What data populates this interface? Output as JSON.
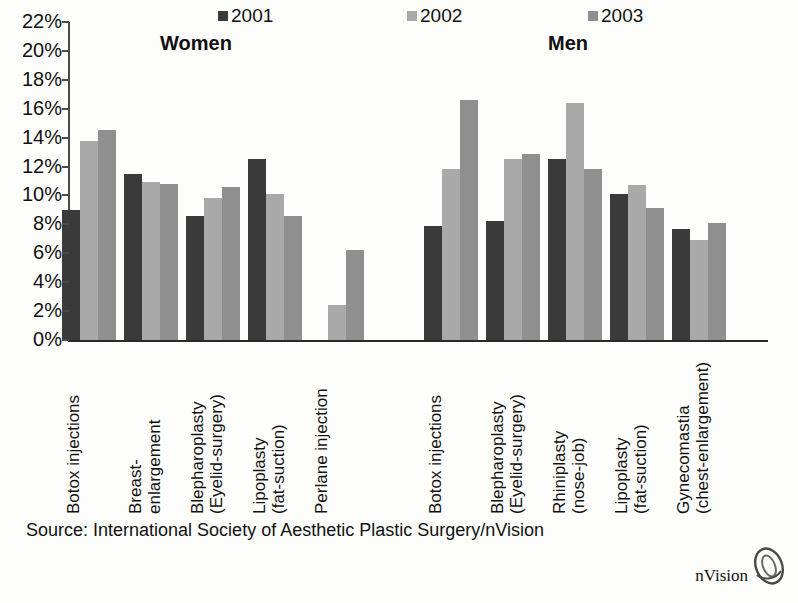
{
  "legend": {
    "items": [
      {
        "label": "2001",
        "color": "#3a3a3a",
        "x": 218
      },
      {
        "label": "2002",
        "color": "#a9a9a9",
        "x": 407
      },
      {
        "label": "2003",
        "color": "#8f8f8f",
        "x": 588
      }
    ]
  },
  "panels": [
    {
      "title": "Women",
      "x": 160
    },
    {
      "title": "Men",
      "x": 548
    }
  ],
  "axis": {
    "ticks": [
      "22%",
      "20%",
      "18%",
      "16%",
      "14%",
      "12%",
      "10%",
      "8%",
      "6%",
      "4%",
      "2%",
      "0%"
    ]
  },
  "source": {
    "text": "Source: International Society of Aesthetic Plastic Surgery/nVision",
    "brand": "nVision"
  },
  "chart_data": {
    "type": "bar",
    "title": "",
    "xlabel": "",
    "ylabel": "",
    "ylim": [
      0,
      22
    ],
    "ytick_step": 2,
    "grid": false,
    "legend_position": "top",
    "units": "percent",
    "series": [
      {
        "name": "2001",
        "color": "#3a3a3a"
      },
      {
        "name": "2002",
        "color": "#a9a9a9"
      },
      {
        "name": "2003",
        "color": "#8f8f8f"
      }
    ],
    "panels": [
      {
        "name": "Women",
        "categories": [
          "Botox injections",
          "Breast-\nenlargement",
          "Blepharoplasty\n(Eyelid-surgery)",
          "Lipoplasty\n(fat-suction)",
          "Perlane injection"
        ],
        "values": {
          "2001": [
            9.0,
            11.5,
            8.6,
            12.5,
            null
          ],
          "2002": [
            13.8,
            10.9,
            9.8,
            10.1,
            2.4
          ],
          "2003": [
            14.5,
            10.8,
            10.6,
            8.6,
            6.2
          ]
        }
      },
      {
        "name": "Men",
        "categories": [
          "Botox injections",
          "Blepharoplasty\n(Eyelid-surgery)",
          "Rhiniplasty\n(nose-job)",
          "Lipoplasty\n(fat-suction)",
          "Gynecomastia\n(chest-enlargement)"
        ],
        "values": {
          "2001": [
            7.9,
            8.2,
            12.5,
            10.1,
            7.7
          ],
          "2002": [
            11.8,
            12.5,
            16.4,
            10.7,
            6.9
          ],
          "2003": [
            16.6,
            12.9,
            11.8,
            9.1,
            8.1
          ]
        }
      }
    ]
  }
}
